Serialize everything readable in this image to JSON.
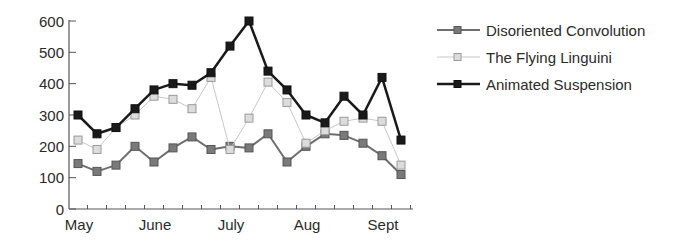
{
  "chart_data": {
    "type": "line",
    "title": "",
    "xlabel": "",
    "ylabel": "",
    "ylim": [
      0,
      600
    ],
    "yticks": [
      0,
      100,
      200,
      300,
      400,
      500,
      600
    ],
    "x_month_labels": [
      {
        "label": "May",
        "index": 0
      },
      {
        "label": "June",
        "index": 4
      },
      {
        "label": "July",
        "index": 8
      },
      {
        "label": "Aug",
        "index": 12
      },
      {
        "label": "Sept",
        "index": 16
      }
    ],
    "x": [
      1,
      2,
      3,
      4,
      5,
      6,
      7,
      8,
      9,
      10,
      11,
      12,
      13,
      14,
      15,
      16,
      17,
      18
    ],
    "grid": false,
    "legend_position": "right",
    "series": [
      {
        "name": "Disoriented Convolution",
        "color": "#6e6e6e",
        "marker_fill": "#7a7a7a",
        "line_width": 2,
        "values": [
          145,
          120,
          140,
          200,
          150,
          195,
          230,
          190,
          200,
          195,
          240,
          150,
          200,
          240,
          235,
          210,
          170,
          110
        ]
      },
      {
        "name": "The Flying Linguini",
        "color": "#c8c8c8",
        "marker_fill": "#dcdcdc",
        "line_width": 1,
        "values": [
          220,
          190,
          260,
          300,
          360,
          350,
          320,
          420,
          190,
          290,
          405,
          340,
          210,
          250,
          280,
          290,
          280,
          140
        ]
      },
      {
        "name": "Animated Suspension",
        "color": "#1a1a1a",
        "marker_fill": "#1a1a1a",
        "line_width": 2.5,
        "values": [
          300,
          240,
          260,
          320,
          380,
          400,
          395,
          435,
          520,
          600,
          440,
          380,
          300,
          275,
          360,
          300,
          420,
          220
        ]
      }
    ]
  }
}
